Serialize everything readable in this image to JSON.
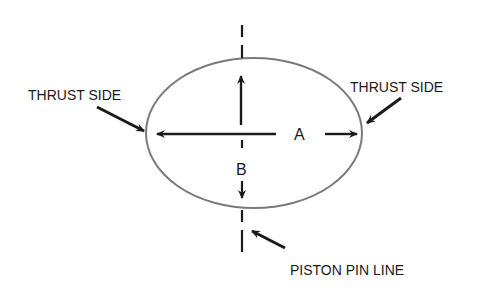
{
  "diagram": {
    "labels": {
      "thrust_left": "THRUST SIDE",
      "thrust_right": "THRUST SIDE",
      "dimension_a": "A",
      "dimension_b": "B",
      "piston_pin_line": "PISTON PIN LINE"
    },
    "colors": {
      "ellipse": "#7a7a7a",
      "ink": "#1a1a1a",
      "background": "#ffffff"
    }
  }
}
